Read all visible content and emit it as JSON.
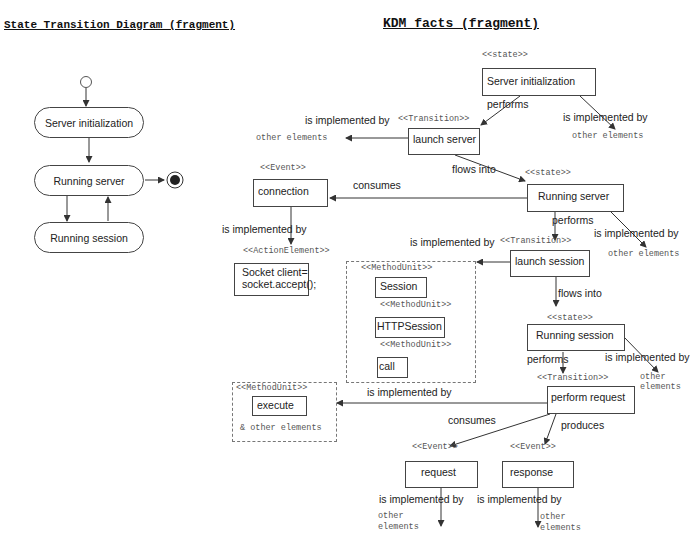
{
  "left_panel": {
    "title": "State Transition Diagram (fragment)",
    "states": [
      {
        "label": "Server initialization"
      },
      {
        "label": "Running server"
      },
      {
        "label": "Running session"
      }
    ]
  },
  "right_panel": {
    "title": "KDM facts (fragment)",
    "stereotypes": {
      "state": "<<state>>",
      "transition": "<<Transition>>",
      "event": "<<Event>>",
      "action_element": "<<ActionElement>>",
      "method_unit": "<<MethodUnit>>"
    },
    "nodes": {
      "server_init": "Server initialization",
      "launch_server": "launch server",
      "connection": "connection",
      "running_server": "Running server",
      "socket_line1": "Socket client=",
      "socket_line2": "socket.accept();",
      "launch_session": "launch session",
      "session": "Session",
      "http_session": "HTTPSession",
      "call": "call",
      "running_session": "Running session",
      "perform_request": "perform request",
      "execute": "execute",
      "execute_other": "& other elements",
      "request": "request",
      "response": "response"
    },
    "edge_labels": {
      "performs": "performs",
      "is_implemented_by": "is implemented by",
      "flows_into": "flows into",
      "consumes": "consumes",
      "produces": "produces",
      "other_elements": "other elements",
      "other": "other",
      "elements": "elements"
    }
  }
}
